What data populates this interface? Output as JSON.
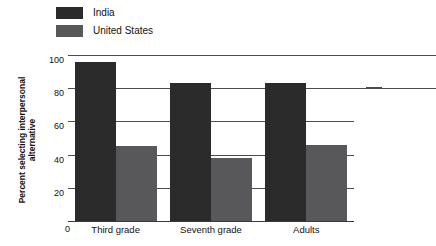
{
  "chart_data": {
    "type": "bar",
    "title": "",
    "subtitle": "",
    "xlabel": "",
    "ylabel": "Percent selecting interpersonal alternative",
    "ylabel_line1": "Percent selecting interpersonal",
    "ylabel_line2": "alternative",
    "categories": [
      "Third grade",
      "Seventh grade",
      "Adults"
    ],
    "series": [
      {
        "name": "India",
        "color": "#2b2b2b",
        "values": [
          96,
          83,
          83
        ]
      },
      {
        "name": "United States",
        "color": "#58585a",
        "values": [
          45,
          38,
          46
        ]
      }
    ],
    "ylim": [
      0,
      100
    ],
    "yticks": [
      0,
      20,
      40,
      60,
      80,
      100
    ],
    "ytick_labels": [
      "0",
      "20",
      "40",
      "60",
      "80",
      "100"
    ],
    "grid": true,
    "grid_axis": "y",
    "legend_position": "top-left",
    "axis_color": "#4c4c4c",
    "background": "#ffffff"
  },
  "legend": {
    "items": [
      {
        "label": "India",
        "color": "#2b2b2b"
      },
      {
        "label": "United States",
        "color": "#58585a"
      }
    ]
  },
  "axes": {
    "y": {
      "ticks": [
        "100",
        "80",
        "60",
        "40",
        "20",
        "0"
      ]
    },
    "x": {
      "labels": [
        "Third grade",
        "Seventh grade",
        "Adults"
      ]
    }
  }
}
